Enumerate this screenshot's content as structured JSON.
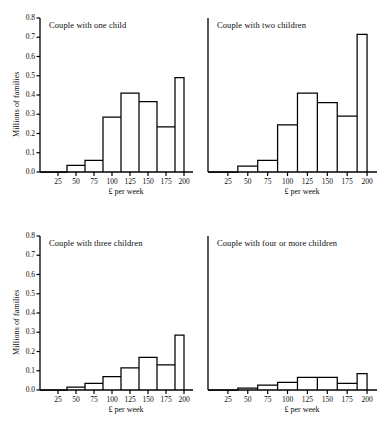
{
  "figure": {
    "axis_ylabel": "Millions of families",
    "axis_xlabel": "£ per week",
    "y_ticks": [
      "0.0",
      "0.1",
      "0.2",
      "0.3",
      "0.4",
      "0.5",
      "0.6",
      "0.7",
      "0.8"
    ],
    "x_ticks": [
      "25",
      "50",
      "75",
      "100",
      "125",
      "150",
      "175",
      "200"
    ],
    "line_color": "#000000",
    "background_color": "#ffffff"
  },
  "chart_data": [
    {
      "type": "bar",
      "id": "couple-one-child",
      "title": "Couple with one child",
      "xlabel": "£ per week",
      "ylabel": "Millions of families",
      "ylim": [
        0.0,
        0.8
      ],
      "xlim": [
        0,
        212.5
      ],
      "grid": false,
      "bin_edges": [
        37.5,
        62.5,
        87.5,
        112.5,
        137.5,
        162.5,
        187.5,
        200,
        200
      ],
      "categories": [
        "37.5-62.5",
        "62.5-87.5",
        "87.5-112.5",
        "112.5-137.5",
        "137.5-162.5",
        "162.5-187.5",
        "187.5-200",
        "200+"
      ],
      "values": [
        0.035,
        0.06,
        0.285,
        0.41,
        0.365,
        0.235,
        0.49,
        0.0
      ],
      "y_ticks": [
        "0.0",
        "0.1",
        "0.2",
        "0.3",
        "0.4",
        "0.5",
        "0.6",
        "0.7",
        "0.8"
      ],
      "x_ticks": [
        "25",
        "50",
        "75",
        "100",
        "125",
        "150",
        "175",
        "200"
      ],
      "show_y_labels": true
    },
    {
      "type": "bar",
      "id": "couple-two-children",
      "title": "Couple with two children",
      "xlabel": "£ per week",
      "ylabel": "Millions of families",
      "ylim": [
        0.0,
        0.8
      ],
      "xlim": [
        0,
        212.5
      ],
      "grid": false,
      "bin_edges": [
        37.5,
        62.5,
        87.5,
        112.5,
        137.5,
        162.5,
        187.5,
        200,
        200
      ],
      "categories": [
        "37.5-62.5",
        "62.5-87.5",
        "87.5-112.5",
        "112.5-137.5",
        "137.5-162.5",
        "162.5-187.5",
        "187.5-200",
        "200+"
      ],
      "values": [
        0.03,
        0.06,
        0.245,
        0.41,
        0.36,
        0.29,
        0.715,
        0.0
      ],
      "y_ticks": [
        "0.0",
        "0.1",
        "0.2",
        "0.3",
        "0.4",
        "0.5",
        "0.6",
        "0.7",
        "0.8"
      ],
      "x_ticks": [
        "25",
        "50",
        "75",
        "100",
        "125",
        "150",
        "175",
        "200"
      ],
      "show_y_labels": false
    },
    {
      "type": "bar",
      "id": "couple-three-children",
      "title": "Couple with three children",
      "xlabel": "£ per week",
      "ylabel": "Millions of families",
      "ylim": [
        0.0,
        0.8
      ],
      "xlim": [
        0,
        212.5
      ],
      "grid": false,
      "bin_edges": [
        37.5,
        62.5,
        87.5,
        112.5,
        137.5,
        162.5,
        187.5,
        200,
        200
      ],
      "categories": [
        "37.5-62.5",
        "62.5-87.5",
        "87.5-112.5",
        "112.5-137.5",
        "137.5-162.5",
        "162.5-187.5",
        "187.5-200",
        "200+"
      ],
      "values": [
        0.015,
        0.035,
        0.07,
        0.115,
        0.17,
        0.13,
        0.285,
        0.0
      ],
      "y_ticks": [
        "0.0",
        "0.1",
        "0.2",
        "0.3",
        "0.4",
        "0.5",
        "0.6",
        "0.7",
        "0.8"
      ],
      "x_ticks": [
        "25",
        "50",
        "75",
        "100",
        "125",
        "150",
        "175",
        "200"
      ],
      "show_y_labels": true
    },
    {
      "type": "bar",
      "id": "couple-four-or-more-children",
      "title": "Couple with four or more children",
      "xlabel": "£ per week",
      "ylabel": "Millions of families",
      "ylim": [
        0.0,
        0.8
      ],
      "xlim": [
        0,
        212.5
      ],
      "grid": false,
      "bin_edges": [
        37.5,
        62.5,
        87.5,
        112.5,
        137.5,
        162.5,
        187.5,
        200,
        200
      ],
      "categories": [
        "37.5-62.5",
        "62.5-87.5",
        "87.5-112.5",
        "112.5-137.5",
        "137.5-162.5",
        "162.5-187.5",
        "187.5-200",
        "200+"
      ],
      "values": [
        0.01,
        0.025,
        0.04,
        0.065,
        0.065,
        0.035,
        0.085,
        0.0
      ],
      "y_ticks": [
        "0.0",
        "0.1",
        "0.2",
        "0.3",
        "0.4",
        "0.5",
        "0.6",
        "0.7",
        "0.8"
      ],
      "x_ticks": [
        "25",
        "50",
        "75",
        "100",
        "125",
        "150",
        "175",
        "200"
      ],
      "show_y_labels": false
    }
  ]
}
